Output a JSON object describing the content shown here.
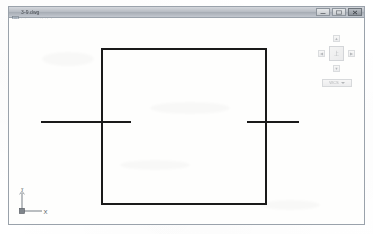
{
  "window": {
    "title": "3-9.dwg",
    "icon": "dwg-file-icon",
    "controls": [
      {
        "name": "minimize-button",
        "glyph": "minimize-icon"
      },
      {
        "name": "maximize-button",
        "glyph": "maximize-icon"
      },
      {
        "name": "close-button",
        "glyph": "close-icon"
      }
    ]
  },
  "viewport": {
    "label": "[-][俯视][二维线框]"
  },
  "view_cube": {
    "face_label": "上",
    "arrow_up": "▲",
    "arrow_left": "◀",
    "arrow_right": "▶",
    "arrow_down": "▼",
    "ucs_menu_label": "WCS"
  },
  "ucs_icon": {
    "x_label": "X",
    "y_label": "Y"
  },
  "colors": {
    "geometry_stroke": "#1a1a1a",
    "canvas_background": "#fefefd",
    "window_border": "#9aa2ab",
    "title_bar_top": "#d4d7dc",
    "title_bar_bottom": "#c3c8cf",
    "ucs_icon_stroke": "#8d9399"
  },
  "drawing": {
    "description": "rectangle with two horizontal lines crossing its left and right edges",
    "canvas_size": {
      "width": 357,
      "height": 206
    },
    "rectangle": {
      "x": 93,
      "y": 30,
      "width": 164,
      "height": 155,
      "stroke_width": 2
    },
    "lines": [
      {
        "name": "left-horizontal-line",
        "x1": 32,
        "y1": 103,
        "x2": 122,
        "y2": 103,
        "stroke_width": 2
      },
      {
        "name": "right-horizontal-line",
        "x1": 238,
        "y1": 103,
        "x2": 290,
        "y2": 103,
        "stroke_width": 2
      }
    ]
  }
}
